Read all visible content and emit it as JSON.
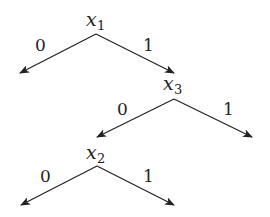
{
  "diagram": {
    "type": "decision-tree",
    "nodes": [
      {
        "id": "n1",
        "var": "x",
        "sub": "1"
      },
      {
        "id": "n3",
        "var": "x",
        "sub": "3"
      },
      {
        "id": "n2",
        "var": "x",
        "sub": "2"
      }
    ],
    "edges": [
      {
        "from": "n1",
        "label": "0",
        "to": "leaf"
      },
      {
        "from": "n1",
        "label": "1",
        "to": "n3"
      },
      {
        "from": "n3",
        "label": "0",
        "to": "n2"
      },
      {
        "from": "n3",
        "label": "1",
        "to": "leaf"
      },
      {
        "from": "n2",
        "label": "0",
        "to": "leaf"
      },
      {
        "from": "n2",
        "label": "1",
        "to": "leaf"
      }
    ]
  }
}
